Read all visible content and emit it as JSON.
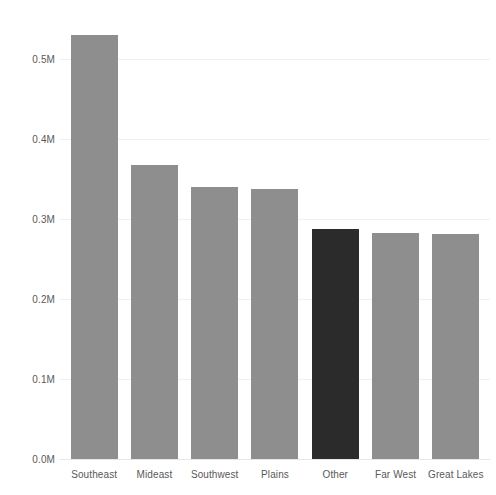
{
  "chart_data": {
    "type": "bar",
    "title": "",
    "subtitle": "",
    "xlabel": "",
    "ylabel": "",
    "categories": [
      "Southeast",
      "Mideast",
      "Southwest",
      "Plains",
      "Other",
      "Far West",
      "Great Lakes"
    ],
    "values": [
      530000,
      368000,
      340000,
      338000,
      288000,
      283000,
      281000
    ],
    "ylim": [
      0,
      560000
    ],
    "y_ticks": [
      0,
      100000,
      200000,
      300000,
      400000,
      500000
    ],
    "y_tick_labels": [
      "0.0M",
      "0.1M",
      "0.2M",
      "0.3M",
      "0.4M",
      "0.5M"
    ],
    "grid": true,
    "legend": "none",
    "bar_colors": [
      "#8e8e8e",
      "#8e8e8e",
      "#8e8e8e",
      "#8e8e8e",
      "#2b2b2b",
      "#8e8e8e",
      "#8e8e8e"
    ],
    "highlight_category": "Other",
    "colors": {
      "background": "#ffffff",
      "bar_default": "#8e8e8e",
      "bar_highlight": "#2b2b2b",
      "gridline": "#f0f0f0",
      "axis_text": "#595959"
    }
  }
}
